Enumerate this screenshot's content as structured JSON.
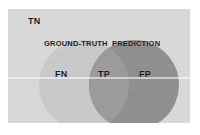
{
  "figure": {
    "type": "venn-diagram",
    "title": "",
    "panel": {
      "background_color": "#d9d9d9"
    },
    "sets": [
      {
        "id": "ground-truth",
        "label": "GROUND-TRUTH",
        "fill_color": "#c9c9c9",
        "center_x": 76,
        "center_y": 76,
        "radius": 45
      },
      {
        "id": "prediction",
        "label": "PREDICTION",
        "fill_color": "#8e8e8e",
        "center_x": 126,
        "center_y": 76,
        "radius": 45
      }
    ],
    "regions": [
      {
        "id": "true-negative",
        "label": "TN",
        "meaning": "outside both circles",
        "fill_color": "#d9d9d9"
      },
      {
        "id": "false-negative",
        "label": "FN",
        "meaning": "ground-truth only",
        "fill_color": "#c9c9c9"
      },
      {
        "id": "true-positive",
        "label": "TP",
        "meaning": "intersection",
        "fill_color": "#9a9a9a"
      },
      {
        "id": "false-positive",
        "label": "FP",
        "meaning": "prediction only",
        "fill_color": "#8e8e8e"
      }
    ],
    "text_color": "#1c1c1c"
  }
}
